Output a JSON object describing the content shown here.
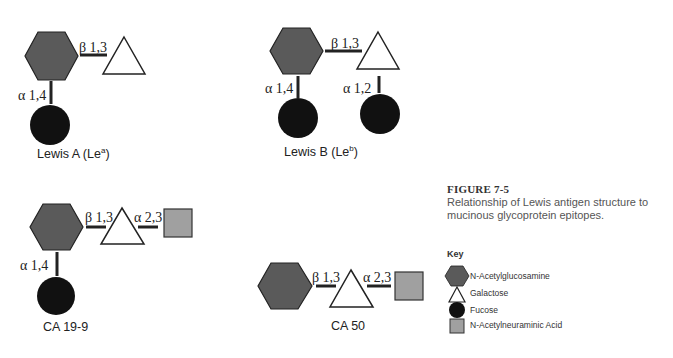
{
  "figure": {
    "title": "FIGURE 7-5",
    "caption": "Relationship of Lewis antigen structure to mucinous glycoprotein epitopes."
  },
  "structures": [
    {
      "name": "Lewis A (Le",
      "sup": "a",
      "close": ")",
      "bonds": [
        "β 1,3",
        "α 1,4"
      ]
    },
    {
      "name": "Lewis B (Le",
      "sup": "b",
      "close": ")",
      "bonds": [
        "β 1,3",
        "α 1,4",
        "α 1,2"
      ]
    },
    {
      "name": "CA 19-9",
      "bonds": [
        "β 1,3",
        "α 2,3",
        "α 1,4"
      ]
    },
    {
      "name": "CA 50",
      "bonds": [
        "β 1,3",
        "α 2,3"
      ]
    }
  ],
  "key": {
    "title": "Key",
    "items": [
      {
        "shape": "hexagon",
        "label": "N-Acetylglucosamine",
        "color": "#5a5a5a"
      },
      {
        "shape": "triangle",
        "label": "Galactose",
        "color": "#ffffff"
      },
      {
        "shape": "circle",
        "label": "Fucose",
        "color": "#111111"
      },
      {
        "shape": "square",
        "label": "N-Acetylneuraminic Acid",
        "color": "#a0a0a0"
      }
    ]
  },
  "colors": {
    "hexagon": "#5a5a5a",
    "circle": "#111111",
    "square": "#a0a0a0",
    "stroke": "#222222"
  }
}
